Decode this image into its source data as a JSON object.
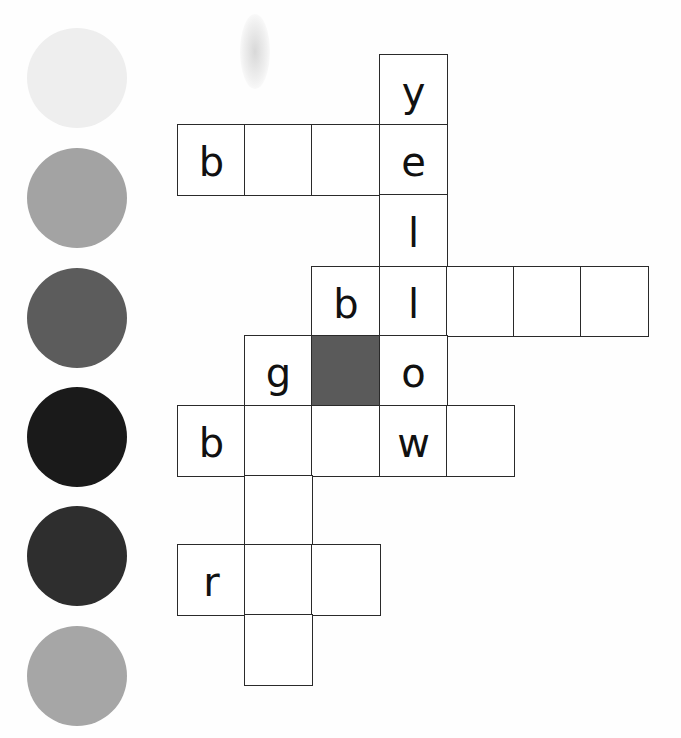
{
  "worksheet": {
    "type": "color-word crossword",
    "color_swatches": [
      {
        "index": 1,
        "color": "#eeeeee",
        "cx": 77,
        "cy": 78
      },
      {
        "index": 2,
        "color": "#a3a3a3",
        "cx": 77,
        "cy": 198
      },
      {
        "index": 3,
        "color": "#5c5c5c",
        "cx": 77,
        "cy": 318
      },
      {
        "index": 4,
        "color": "#1a1a1a",
        "cx": 77,
        "cy": 437
      },
      {
        "index": 5,
        "color": "#2e2e2e",
        "cx": 77,
        "cy": 556
      },
      {
        "index": 6,
        "color": "#a6a6a6",
        "cx": 77,
        "cy": 676
      }
    ],
    "grid": {
      "col_x": [
        178,
        245,
        312,
        380,
        447,
        514,
        581,
        648
      ],
      "row_y": [
        55,
        125,
        195,
        267,
        336,
        406,
        476,
        545,
        615,
        685
      ],
      "shaded_color": "#5a5a5a",
      "cells": [
        {
          "row": 0,
          "col": 3,
          "letter": "y"
        },
        {
          "row": 1,
          "col": 0,
          "letter": "b"
        },
        {
          "row": 1,
          "col": 1,
          "letter": ""
        },
        {
          "row": 1,
          "col": 2,
          "letter": ""
        },
        {
          "row": 1,
          "col": 3,
          "letter": "e"
        },
        {
          "row": 2,
          "col": 3,
          "letter": "l"
        },
        {
          "row": 3,
          "col": 2,
          "letter": "b"
        },
        {
          "row": 3,
          "col": 3,
          "letter": "l"
        },
        {
          "row": 3,
          "col": 4,
          "letter": ""
        },
        {
          "row": 3,
          "col": 5,
          "letter": ""
        },
        {
          "row": 3,
          "col": 6,
          "letter": ""
        },
        {
          "row": 4,
          "col": 1,
          "letter": "g"
        },
        {
          "row": 4,
          "col": 2,
          "letter": "",
          "shaded": true
        },
        {
          "row": 4,
          "col": 3,
          "letter": "o"
        },
        {
          "row": 5,
          "col": 0,
          "letter": "b"
        },
        {
          "row": 5,
          "col": 1,
          "letter": ""
        },
        {
          "row": 5,
          "col": 2,
          "letter": ""
        },
        {
          "row": 5,
          "col": 3,
          "letter": "w"
        },
        {
          "row": 5,
          "col": 4,
          "letter": ""
        },
        {
          "row": 6,
          "col": 1,
          "letter": ""
        },
        {
          "row": 7,
          "col": 0,
          "letter": "r"
        },
        {
          "row": 7,
          "col": 1,
          "letter": ""
        },
        {
          "row": 7,
          "col": 2,
          "letter": ""
        },
        {
          "row": 8,
          "col": 1,
          "letter": ""
        }
      ]
    }
  }
}
